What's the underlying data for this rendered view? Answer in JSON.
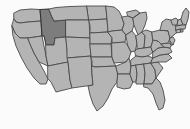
{
  "figure": {
    "kind": "locator-map",
    "title": "United States state locator map",
    "caption": "",
    "width": 190,
    "height": 129
  },
  "map": {
    "region": "United States of America (contiguous 48 states)",
    "projection_look": "albers-usa",
    "background_color": "#fbfbfb",
    "state_fill_color": "#b4b4b4",
    "state_border_color": "#4a4a4a",
    "highlight_fill_color": "#7d7d7d",
    "highlight_border_color": "#333333",
    "highlighted_states": [
      "Idaho"
    ],
    "legend": {
      "visible": false,
      "entries": []
    },
    "labels": {
      "visible": false,
      "entries": []
    },
    "states": [
      {
        "code": "WA",
        "name": "Washington",
        "highlighted": false
      },
      {
        "code": "OR",
        "name": "Oregon",
        "highlighted": false
      },
      {
        "code": "CA",
        "name": "California",
        "highlighted": false
      },
      {
        "code": "NV",
        "name": "Nevada",
        "highlighted": false
      },
      {
        "code": "ID",
        "name": "Idaho",
        "highlighted": true
      },
      {
        "code": "MT",
        "name": "Montana",
        "highlighted": false
      },
      {
        "code": "WY",
        "name": "Wyoming",
        "highlighted": false
      },
      {
        "code": "UT",
        "name": "Utah",
        "highlighted": false
      },
      {
        "code": "AZ",
        "name": "Arizona",
        "highlighted": false
      },
      {
        "code": "NM",
        "name": "New Mexico",
        "highlighted": false
      },
      {
        "code": "CO",
        "name": "Colorado",
        "highlighted": false
      },
      {
        "code": "ND",
        "name": "North Dakota",
        "highlighted": false
      },
      {
        "code": "SD",
        "name": "South Dakota",
        "highlighted": false
      },
      {
        "code": "NE",
        "name": "Nebraska",
        "highlighted": false
      },
      {
        "code": "KS",
        "name": "Kansas",
        "highlighted": false
      },
      {
        "code": "OK",
        "name": "Oklahoma",
        "highlighted": false
      },
      {
        "code": "TX",
        "name": "Texas",
        "highlighted": false
      },
      {
        "code": "MN",
        "name": "Minnesota",
        "highlighted": false
      },
      {
        "code": "IA",
        "name": "Iowa",
        "highlighted": false
      },
      {
        "code": "MO",
        "name": "Missouri",
        "highlighted": false
      },
      {
        "code": "AR",
        "name": "Arkansas",
        "highlighted": false
      },
      {
        "code": "LA",
        "name": "Louisiana",
        "highlighted": false
      },
      {
        "code": "WI",
        "name": "Wisconsin",
        "highlighted": false
      },
      {
        "code": "IL",
        "name": "Illinois",
        "highlighted": false
      },
      {
        "code": "MI",
        "name": "Michigan",
        "highlighted": false
      },
      {
        "code": "IN",
        "name": "Indiana",
        "highlighted": false
      },
      {
        "code": "OH",
        "name": "Ohio",
        "highlighted": false
      },
      {
        "code": "KY",
        "name": "Kentucky",
        "highlighted": false
      },
      {
        "code": "TN",
        "name": "Tennessee",
        "highlighted": false
      },
      {
        "code": "MS",
        "name": "Mississippi",
        "highlighted": false
      },
      {
        "code": "AL",
        "name": "Alabama",
        "highlighted": false
      },
      {
        "code": "GA",
        "name": "Georgia",
        "highlighted": false
      },
      {
        "code": "FL",
        "name": "Florida",
        "highlighted": false
      },
      {
        "code": "SC",
        "name": "South Carolina",
        "highlighted": false
      },
      {
        "code": "NC",
        "name": "North Carolina",
        "highlighted": false
      },
      {
        "code": "VA",
        "name": "Virginia",
        "highlighted": false
      },
      {
        "code": "WV",
        "name": "West Virginia",
        "highlighted": false
      },
      {
        "code": "MD",
        "name": "Maryland",
        "highlighted": false
      },
      {
        "code": "DE",
        "name": "Delaware",
        "highlighted": false
      },
      {
        "code": "NJ",
        "name": "New Jersey",
        "highlighted": false
      },
      {
        "code": "PA",
        "name": "Pennsylvania",
        "highlighted": false
      },
      {
        "code": "NY",
        "name": "New York",
        "highlighted": false
      },
      {
        "code": "CT",
        "name": "Connecticut",
        "highlighted": false
      },
      {
        "code": "RI",
        "name": "Rhode Island",
        "highlighted": false
      },
      {
        "code": "MA",
        "name": "Massachusetts",
        "highlighted": false
      },
      {
        "code": "VT",
        "name": "Vermont",
        "highlighted": false
      },
      {
        "code": "NH",
        "name": "New Hampshire",
        "highlighted": false
      },
      {
        "code": "ME",
        "name": "Maine",
        "highlighted": false
      }
    ]
  }
}
